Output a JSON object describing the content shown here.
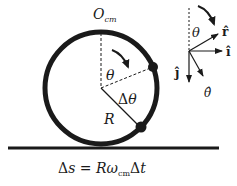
{
  "diagram": {
    "labels": {
      "origin": "O",
      "origin_sub": "cm",
      "theta_inner": "θ",
      "delta_theta": "Δθ",
      "radius": "R",
      "theta_vec": "θ",
      "r_hat": "r̂",
      "i_hat": "î",
      "j_hat": "ĵ",
      "theta_hat": "θ̂"
    },
    "equation": {
      "lhs": "Δs",
      "eq": " = ",
      "r": "R",
      "omega": "ω",
      "sub": "cm",
      "dt": "Δt"
    },
    "colors": {
      "ink": "#1a1a1a",
      "background": "#ffffff"
    }
  }
}
